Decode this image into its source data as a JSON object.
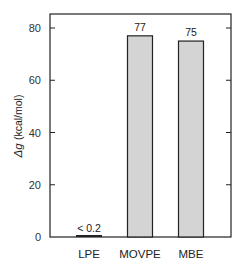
{
  "chart_data": {
    "type": "bar",
    "title": "",
    "xlabel": "",
    "ylabel": "Δg (kcal/mol)",
    "ylabel_symbol": "Δg",
    "ylabel_unit": "(kcal/mol)",
    "categories": [
      "LPE",
      "MOVPE",
      "MBE"
    ],
    "values": [
      0.2,
      77,
      75
    ],
    "value_labels": [
      "< 0.2",
      "77",
      "75"
    ],
    "ylim": [
      0,
      85
    ],
    "yticks": [
      0,
      20,
      40,
      60,
      80
    ],
    "ytick_labels": [
      "0",
      "20",
      "40",
      "60",
      "80"
    ],
    "grid": false,
    "legend": null,
    "colors": {
      "bar_fill": "#d4d4d4",
      "bar_stroke": "#222222",
      "axis": "#222222"
    }
  }
}
